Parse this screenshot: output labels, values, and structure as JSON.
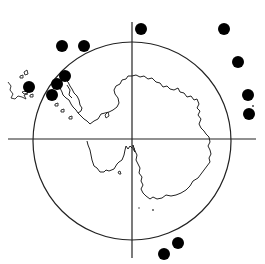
{
  "figure": {
    "description": "Polar stereographic map of Antarctica with circle and crosshair axes; black dots mark sample locations",
    "colors": {
      "background": "#ffffff",
      "ink": "#1a1a1a",
      "dot": "#000000"
    },
    "axes": {
      "horizontal": {
        "x1": 8,
        "y1": 139,
        "x2": 256,
        "y2": 139
      },
      "vertical": {
        "x1": 132,
        "y1": 22,
        "x2": 132,
        "y2": 258
      }
    },
    "circle": {
      "cx": 132,
      "cy": 141,
      "r": 99
    },
    "dots": [
      {
        "x": 62,
        "y": 46,
        "r": 6
      },
      {
        "x": 84,
        "y": 46,
        "r": 6
      },
      {
        "x": 141,
        "y": 29,
        "r": 6
      },
      {
        "x": 224,
        "y": 29,
        "r": 6
      },
      {
        "x": 238,
        "y": 62,
        "r": 6
      },
      {
        "x": 248,
        "y": 95,
        "r": 6
      },
      {
        "x": 249,
        "y": 114,
        "r": 6
      },
      {
        "x": 29,
        "y": 87,
        "r": 6
      },
      {
        "x": 65,
        "y": 76,
        "r": 6
      },
      {
        "x": 57,
        "y": 84,
        "r": 6
      },
      {
        "x": 52,
        "y": 95,
        "r": 6
      },
      {
        "x": 178,
        "y": 243,
        "r": 6
      },
      {
        "x": 164,
        "y": 254,
        "r": 6
      }
    ],
    "dot_count": "13"
  }
}
